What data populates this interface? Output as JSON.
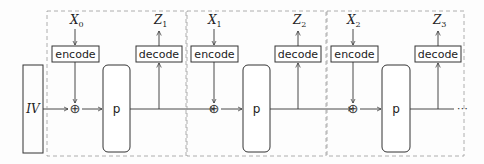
{
  "diagram": {
    "type": "sponge-like chained permutation mode",
    "iv_label": "IV",
    "stages": [
      {
        "input": "X",
        "input_sub": "0",
        "encode_label": "encode",
        "xor_symbol": "⊕",
        "perm_label": "p",
        "decode_label": "decode",
        "output": "Z",
        "output_sub": "1"
      },
      {
        "input": "X",
        "input_sub": "1",
        "encode_label": "encode",
        "xor_symbol": "⊕",
        "perm_label": "p",
        "decode_label": "decode",
        "output": "Z",
        "output_sub": "2"
      },
      {
        "input": "X",
        "input_sub": "2",
        "encode_label": "encode",
        "xor_symbol": "⊕",
        "perm_label": "p",
        "decode_label": "decode",
        "output": "Z",
        "output_sub": "3"
      }
    ],
    "continuation": "⋯",
    "colors": {
      "stroke": "#333333",
      "dashed": "#9a9a9a",
      "background": "#fdfdfd"
    }
  }
}
